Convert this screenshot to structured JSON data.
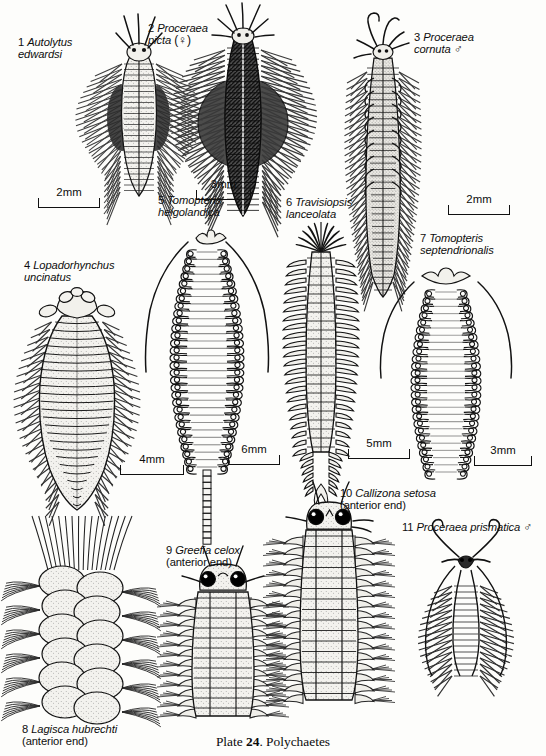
{
  "plate": {
    "caption_prefix": "Plate ",
    "caption_number": "24",
    "caption_suffix": ". Polychaetes"
  },
  "figures": [
    {
      "id": 1,
      "number": "1",
      "species": "Autolytus\nedwardsi",
      "qualifier": "",
      "sex": "",
      "label_x": 18,
      "label_y": 36,
      "label_align": "left"
    },
    {
      "id": 2,
      "number": "2",
      "species": "Proceraea\npicta",
      "qualifier": "",
      "sex": "(♀)",
      "label_x": 148,
      "label_y": 22,
      "label_align": "left"
    },
    {
      "id": 3,
      "number": "3",
      "species": "Proceraea\ncornuta",
      "qualifier": "",
      "sex": "♂",
      "label_x": 414,
      "label_y": 31,
      "label_align": "left"
    },
    {
      "id": 4,
      "number": "4",
      "species": "Lopadorhynchus\nuncinatus",
      "qualifier": "",
      "sex": "",
      "label_x": 24,
      "label_y": 259,
      "label_align": "left"
    },
    {
      "id": 5,
      "number": "5",
      "species": "Tomopteris\nhelgolandica",
      "qualifier": "",
      "sex": "",
      "label_x": 158,
      "label_y": 194,
      "label_align": "left"
    },
    {
      "id": 6,
      "number": "6",
      "species": "Travisiopsis\nlanceolata",
      "qualifier": "",
      "sex": "",
      "label_x": 286,
      "label_y": 196,
      "label_align": "left"
    },
    {
      "id": 7,
      "number": "7",
      "species": "Tomopteris\nseptendrionalis",
      "qualifier": "",
      "sex": "",
      "label_x": 420,
      "label_y": 232,
      "label_align": "left"
    },
    {
      "id": 8,
      "number": "8",
      "species": "Lagisca hubrechti",
      "qualifier": "(anterior end)",
      "sex": "",
      "label_x": 22,
      "label_y": 723,
      "label_align": "left"
    },
    {
      "id": 9,
      "number": "9",
      "species": "Greefia celox",
      "qualifier": "(anterior end)",
      "sex": "",
      "label_x": 166,
      "label_y": 544,
      "label_align": "left"
    },
    {
      "id": 10,
      "number": "10",
      "species": "Callizona setosa",
      "qualifier": "(anterior end)",
      "sex": "",
      "label_x": 340,
      "label_y": 487,
      "label_align": "left"
    },
    {
      "id": 11,
      "number": "11",
      "species": "Proceraea prismatica",
      "qualifier": "",
      "sex": "♂",
      "label_x": 402,
      "label_y": 521,
      "label_align": "left"
    }
  ],
  "scale_bars": [
    {
      "for_figure": "1",
      "text": "2mm",
      "x": 38,
      "y": 186,
      "width": 62
    },
    {
      "for_figure": "2",
      "text": "3mm",
      "x": 196,
      "y": 178,
      "width": 55
    },
    {
      "for_figure": "3",
      "text": "2mm",
      "x": 448,
      "y": 193,
      "width": 62
    },
    {
      "for_figure": "4",
      "text": "4mm",
      "x": 120,
      "y": 453,
      "width": 64
    },
    {
      "for_figure": "5",
      "text": "6mm",
      "x": 228,
      "y": 443,
      "width": 52
    },
    {
      "for_figure": "6",
      "text": "5mm",
      "x": 348,
      "y": 437,
      "width": 62
    },
    {
      "for_figure": "7",
      "text": "3mm",
      "x": 474,
      "y": 444,
      "width": 58
    }
  ],
  "colors": {
    "background": "#fdfdfb",
    "ink": "#111111",
    "body_fill": "#f1f0ec",
    "dark_fill": "#3a3a3a",
    "eye": "#000000"
  }
}
